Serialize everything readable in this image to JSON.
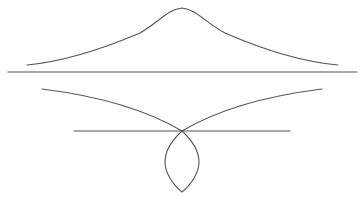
{
  "diagram": {
    "width": 361,
    "height": 205,
    "background": "#ffffff",
    "stroke_color": "#555555",
    "stroke_width": 1.1,
    "elements": [
      {
        "id": "bell-curve",
        "type": "path",
        "d": "M 27 65 C 60 62 100 50 140 33 C 158 23 168 9 182 8 C 196 9 206 23 225 33 C 264 50 304 62 338 65"
      },
      {
        "id": "baseline-long",
        "type": "line",
        "x1": 8,
        "y1": 72,
        "x2": 357,
        "y2": 72
      },
      {
        "id": "left-branch",
        "type": "path",
        "d": "M 42 89 C 90 95 140 106 182 131"
      },
      {
        "id": "right-branch",
        "type": "path",
        "d": "M 322 89 C 274 95 224 106 182 131"
      },
      {
        "id": "baseline-short",
        "type": "line",
        "x1": 74,
        "y1": 131,
        "x2": 290,
        "y2": 131
      },
      {
        "id": "loop",
        "type": "path",
        "d": "M 182 131 C 170 142 165 152 165 162 C 165 172 172 184 182 192 C 192 184 199 172 199 162 C 199 152 194 142 182 131 Z"
      }
    ]
  }
}
